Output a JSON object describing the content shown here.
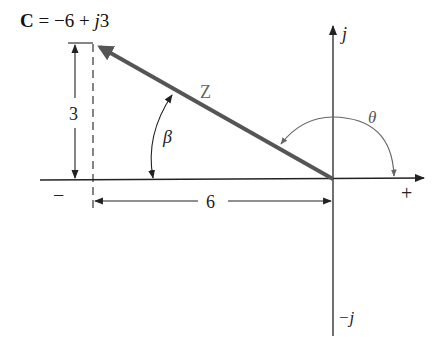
{
  "title": {
    "bold_symbol": "C",
    "expression": " = −6 + ",
    "j": "j",
    "imag": "3"
  },
  "labels": {
    "vector": "Z",
    "beta": "β",
    "theta": "θ",
    "j_axis": "j",
    "neg_j_axis": "−j",
    "plus": "+",
    "minus": "−",
    "height": "3",
    "width": "6"
  },
  "colors": {
    "vector": "#555555",
    "angle_arc": "#666666",
    "axis": "#222222",
    "text": "#111111"
  },
  "phasor": {
    "real": -6,
    "imag": 3
  }
}
